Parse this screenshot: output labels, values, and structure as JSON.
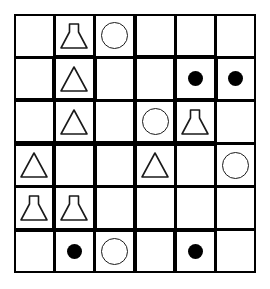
{
  "diagram": {
    "rows": 6,
    "cols": 6,
    "colors": {
      "background": "#ffffff",
      "line": "#000000",
      "shape_outline": "#1a1a1a",
      "shape_fill": "#000000"
    },
    "legend": {
      "flask": "conical-flask",
      "triangle": "triangle",
      "circle": "circle-outline",
      "dot": "filled-circle",
      "empty": "empty"
    },
    "cells": [
      [
        {
          "shape": "empty",
          "top": "thin",
          "right": "thin",
          "bottom": "thin",
          "left": "thin"
        },
        {
          "shape": "flask",
          "top": "thin",
          "right": "thin",
          "bottom": "thick",
          "left": "thin"
        },
        {
          "shape": "circle",
          "top": "thin",
          "right": "thin",
          "bottom": "thin",
          "left": "thin"
        },
        {
          "shape": "empty",
          "top": "thin",
          "right": "thin",
          "bottom": "thick",
          "left": "thin"
        },
        {
          "shape": "empty",
          "top": "thin",
          "right": "thin",
          "bottom": "thick",
          "left": "thin"
        },
        {
          "shape": "empty",
          "top": "thin",
          "right": "thin",
          "bottom": "thin",
          "left": "thin"
        }
      ],
      [
        {
          "shape": "empty",
          "top": "thin",
          "right": "thick",
          "bottom": "thin",
          "left": "thin"
        },
        {
          "shape": "triangle",
          "top": "thick",
          "right": "thick",
          "bottom": "thick",
          "left": "thick"
        },
        {
          "shape": "empty",
          "top": "thin",
          "right": "thick",
          "bottom": "thin",
          "left": "thick"
        },
        {
          "shape": "empty",
          "top": "thick",
          "right": "thick",
          "bottom": "thin",
          "left": "thick"
        },
        {
          "shape": "dot",
          "top": "thick",
          "right": "thick",
          "bottom": "thick",
          "left": "thick"
        },
        {
          "shape": "dot",
          "top": "thin",
          "right": "thin",
          "bottom": "thin",
          "left": "thick"
        }
      ],
      [
        {
          "shape": "empty",
          "top": "thick",
          "right": "thin",
          "bottom": "thick",
          "left": "thin"
        },
        {
          "shape": "triangle",
          "top": "thick",
          "right": "thin",
          "bottom": "thick",
          "left": "thin"
        },
        {
          "shape": "empty",
          "top": "thin",
          "right": "thin",
          "bottom": "thick",
          "left": "thin"
        },
        {
          "shape": "circle",
          "top": "thin",
          "right": "thick",
          "bottom": "thick",
          "left": "thin"
        },
        {
          "shape": "flask",
          "top": "thick",
          "right": "thin",
          "bottom": "thick",
          "left": "thick"
        },
        {
          "shape": "empty",
          "top": "thin",
          "right": "thin",
          "bottom": "thin",
          "left": "thin"
        }
      ],
      [
        {
          "shape": "triangle",
          "top": "thick",
          "right": "thick",
          "bottom": "thin",
          "left": "thin"
        },
        {
          "shape": "empty",
          "top": "thick",
          "right": "thick",
          "bottom": "thin",
          "left": "thick"
        },
        {
          "shape": "empty",
          "top": "thick",
          "right": "thin",
          "bottom": "thin",
          "left": "thick"
        },
        {
          "shape": "triangle",
          "top": "thick",
          "right": "thin",
          "bottom": "thin",
          "left": "thin"
        },
        {
          "shape": "empty",
          "top": "thick",
          "right": "thin",
          "bottom": "thin",
          "left": "thin"
        },
        {
          "shape": "circle",
          "top": "thin",
          "right": "thin",
          "bottom": "thin",
          "left": "thin"
        }
      ],
      [
        {
          "shape": "flask",
          "top": "thin",
          "right": "thick",
          "bottom": "thick",
          "left": "thin"
        },
        {
          "shape": "flask",
          "top": "thin",
          "right": "thick",
          "bottom": "thick",
          "left": "thick"
        },
        {
          "shape": "empty",
          "top": "thin",
          "right": "thick",
          "bottom": "thick",
          "left": "thick"
        },
        {
          "shape": "empty",
          "top": "thin",
          "right": "thin",
          "bottom": "thick",
          "left": "thick"
        },
        {
          "shape": "empty",
          "top": "thin",
          "right": "thin",
          "bottom": "thick",
          "left": "thin"
        },
        {
          "shape": "empty",
          "top": "thin",
          "right": "thin",
          "bottom": "thin",
          "left": "thin"
        }
      ],
      [
        {
          "shape": "empty",
          "top": "thick",
          "right": "thin",
          "bottom": "thin",
          "left": "thin"
        },
        {
          "shape": "dot",
          "top": "thick",
          "right": "thin",
          "bottom": "thin",
          "left": "thin"
        },
        {
          "shape": "circle",
          "top": "thick",
          "right": "thin",
          "bottom": "thin",
          "left": "thin"
        },
        {
          "shape": "empty",
          "top": "thick",
          "right": "thick",
          "bottom": "thin",
          "left": "thin"
        },
        {
          "shape": "dot",
          "top": "thick",
          "right": "thin",
          "bottom": "thin",
          "left": "thick"
        },
        {
          "shape": "empty",
          "top": "thin",
          "right": "thin",
          "bottom": "thin",
          "left": "thin"
        }
      ]
    ]
  }
}
